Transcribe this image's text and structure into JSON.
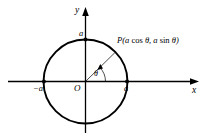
{
  "figure": {
    "type": "geometry-diagram",
    "background_color": "#ffffff",
    "stroke_color": "#000000",
    "canvas": {
      "width": 210,
      "height": 140
    }
  },
  "axes": {
    "x_label": "x",
    "y_label": "y",
    "origin_label": "O",
    "x_axis": {
      "x1": 8,
      "y1": 81.5,
      "x2": 198,
      "y2": 81.5,
      "arrow": "right"
    },
    "y_axis": {
      "x1": 85.5,
      "y1": 133,
      "x2": 85.5,
      "y2": 8,
      "arrow": "up"
    }
  },
  "circle": {
    "center_x": 85.5,
    "center_y": 81.5,
    "radius": 42,
    "stroke_width": 1.9
  },
  "points": [
    {
      "name": "left-intercept",
      "label": "−a",
      "cx": 44,
      "cy": 81.5,
      "label_x": 33,
      "label_y": 90
    },
    {
      "name": "right-intercept",
      "label": "a",
      "cx": 127,
      "cy": 81.5,
      "label_x": 124,
      "label_y": 90
    },
    {
      "name": "top-intercept",
      "label": "a",
      "cx": 85.5,
      "cy": 39.5,
      "label_x": 79,
      "label_y": 36
    }
  ],
  "radius_line": {
    "from_x": 85.5,
    "from_y": 81.5,
    "to_x": 115.5,
    "to_y": 52,
    "stroke_width": 0.7
  },
  "angle": {
    "symbol": "θ",
    "label_x": 94,
    "label_y": 77,
    "arc_radius": 20,
    "arrow": "counterclockwise"
  },
  "point_label": {
    "prefix": "P(",
    "x_expr_coef": "a",
    "x_expr_fn": "cos",
    "x_expr_arg": "θ",
    "separator": ", ",
    "y_expr_coef": "a",
    "y_expr_fn": "sin",
    "y_expr_arg": "θ",
    "suffix": ")",
    "full_text": "P(a cos θ, a sin θ)",
    "pos_x": 117,
    "pos_y": 41
  }
}
